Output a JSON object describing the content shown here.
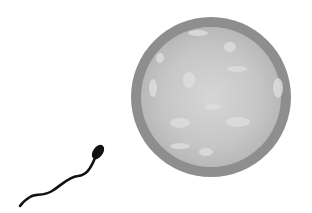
{
  "scene": {
    "description": "Illustration of a sperm cell swimming toward an egg cell",
    "background": "#ffffff",
    "egg": {
      "outer_color": "#8f8f8f",
      "inner_color": "#c4c4c4",
      "highlight_color": "#d8d8d8",
      "spot_color": "#dcdcdc"
    },
    "sperm": {
      "color": "#111111"
    }
  }
}
